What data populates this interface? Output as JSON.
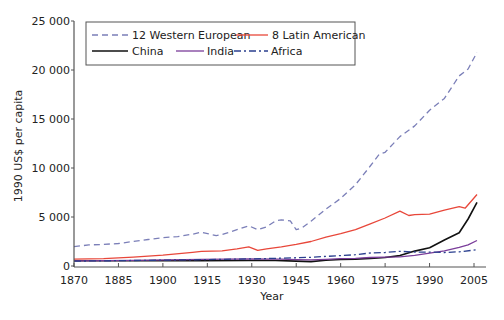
{
  "chart_data": {
    "type": "line",
    "title": "",
    "xlabel": "Year",
    "ylabel": "1990 US$ per capita",
    "xlim": [
      1870,
      2008
    ],
    "ylim": [
      0,
      25000
    ],
    "x_ticks": [
      1870,
      1885,
      1900,
      1915,
      1930,
      1945,
      1960,
      1975,
      1990,
      2005
    ],
    "y_ticks": [
      0,
      5000,
      10000,
      15000,
      20000,
      25000
    ],
    "y_tick_labels": [
      "0",
      "5 000",
      "10 000",
      "15 000",
      "20 000",
      "25 000"
    ],
    "grid": false,
    "legend_position": "upper-left, inside plot, boxed, 2 columns",
    "series": [
      {
        "name": "12 Western European",
        "color": "#7b7fb8",
        "style": "dashed",
        "x": [
          1870,
          1875,
          1880,
          1885,
          1890,
          1895,
          1900,
          1905,
          1910,
          1913,
          1918,
          1920,
          1925,
          1929,
          1932,
          1935,
          1938,
          1940,
          1943,
          1945,
          1947,
          1950,
          1955,
          1960,
          1965,
          1970,
          1973,
          1975,
          1980,
          1985,
          1990,
          1995,
          2000,
          2003,
          2006
        ],
        "values": [
          1970,
          2150,
          2200,
          2300,
          2500,
          2700,
          2900,
          3000,
          3250,
          3450,
          3100,
          3200,
          3700,
          4100,
          3700,
          4000,
          4600,
          4700,
          4600,
          3700,
          3900,
          4570,
          5800,
          6900,
          8300,
          10200,
          11400,
          11600,
          13200,
          14300,
          15900,
          17100,
          19400,
          20100,
          21800
        ]
      },
      {
        "name": "8 Latin American",
        "color": "#e8473a",
        "style": "solid",
        "x": [
          1870,
          1880,
          1890,
          1900,
          1910,
          1913,
          1920,
          1925,
          1929,
          1932,
          1935,
          1940,
          1945,
          1950,
          1955,
          1960,
          1965,
          1970,
          1975,
          1980,
          1983,
          1985,
          1990,
          1995,
          2000,
          2002,
          2006
        ],
        "values": [
          700,
          750,
          900,
          1100,
          1400,
          1500,
          1550,
          1750,
          1950,
          1600,
          1750,
          1950,
          2200,
          2500,
          2950,
          3300,
          3700,
          4300,
          4900,
          5600,
          5150,
          5250,
          5300,
          5700,
          6050,
          5900,
          7300
        ]
      },
      {
        "name": "China",
        "color": "#111111",
        "style": "solid",
        "x": [
          1870,
          1890,
          1913,
          1929,
          1938,
          1945,
          1950,
          1955,
          1960,
          1965,
          1970,
          1975,
          1980,
          1985,
          1990,
          1995,
          2000,
          2003,
          2006
        ],
        "values": [
          530,
          540,
          550,
          560,
          560,
          500,
          450,
          580,
          660,
          700,
          780,
          870,
          1060,
          1520,
          1870,
          2650,
          3400,
          4800,
          6500
        ]
      },
      {
        "name": "India",
        "color": "#7a3d9a",
        "style": "solid",
        "x": [
          1870,
          1890,
          1913,
          1929,
          1940,
          1945,
          1950,
          1955,
          1960,
          1965,
          1970,
          1975,
          1980,
          1985,
          1990,
          1995,
          2000,
          2003,
          2006
        ],
        "values": [
          530,
          580,
          670,
          730,
          690,
          640,
          620,
          680,
          750,
          790,
          870,
          900,
          940,
          1080,
          1310,
          1550,
          1900,
          2150,
          2600
        ]
      },
      {
        "name": "Africa",
        "color": "#2a3f8f",
        "style": "dash-dot",
        "x": [
          1870,
          1890,
          1913,
          1929,
          1940,
          1950,
          1955,
          1960,
          1965,
          1970,
          1975,
          1980,
          1985,
          1990,
          1995,
          2000,
          2006
        ],
        "values": [
          500,
          560,
          640,
          720,
          800,
          890,
          980,
          1060,
          1150,
          1330,
          1380,
          1500,
          1430,
          1420,
          1380,
          1450,
          1650
        ]
      }
    ]
  },
  "legend": {
    "items": [
      {
        "label": "12 Western European",
        "color": "#7b7fb8",
        "dash": "6,4"
      },
      {
        "label": "8 Latin American",
        "color": "#e8473a",
        "dash": ""
      },
      {
        "label": "China",
        "color": "#111111",
        "dash": ""
      },
      {
        "label": "India",
        "color": "#7a3d9a",
        "dash": ""
      },
      {
        "label": "Africa",
        "color": "#2a3f8f",
        "dash": "7,3,2,3"
      }
    ]
  },
  "axes": {
    "x_title": "Year",
    "y_title": "1990 US$ per capita"
  }
}
